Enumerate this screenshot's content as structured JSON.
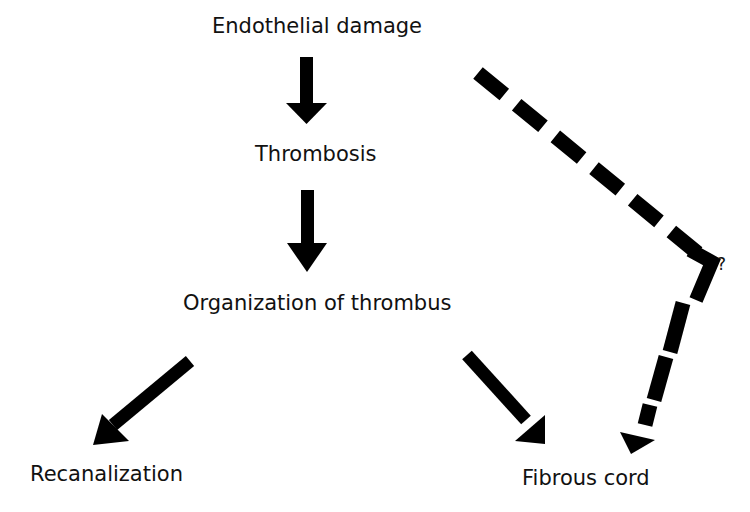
{
  "diagram": {
    "type": "flowchart",
    "nodes": [
      {
        "id": "endothelial_damage",
        "label": "Endothelial damage"
      },
      {
        "id": "thrombosis",
        "label": "Thrombosis"
      },
      {
        "id": "organization",
        "label": "Organization of thrombus"
      },
      {
        "id": "recanalization",
        "label": "Recanalization"
      },
      {
        "id": "fibrous_cord",
        "label": "Fibrous cord"
      }
    ],
    "edges": [
      {
        "from": "endothelial_damage",
        "to": "thrombosis",
        "style": "solid"
      },
      {
        "from": "thrombosis",
        "to": "organization",
        "style": "solid"
      },
      {
        "from": "organization",
        "to": "recanalization",
        "style": "solid"
      },
      {
        "from": "organization",
        "to": "fibrous_cord",
        "style": "solid"
      },
      {
        "from": "endothelial_damage",
        "to": "fibrous_cord",
        "style": "dashed",
        "annotation": "?"
      }
    ],
    "uncertain_path_label": "?",
    "colors": {
      "background": "#ffffff",
      "arrow": "#000000",
      "text": "#111111"
    }
  }
}
